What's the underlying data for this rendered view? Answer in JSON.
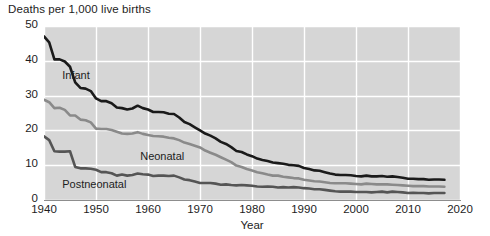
{
  "chart_data": {
    "type": "line",
    "title": "Deaths per 1,000 live births",
    "subtitle": "",
    "xlabel": "Year",
    "ylabel": "Deaths per 1,000 live births",
    "xlim": [
      1940,
      2020
    ],
    "ylim": [
      0,
      50
    ],
    "grid": true,
    "legend_position": "inline-annotations",
    "xticks": [
      "1940",
      "1950",
      "1960",
      "1970",
      "1980",
      "1990",
      "2000",
      "2010",
      "2020"
    ],
    "xtick_values": [
      1940,
      1950,
      1960,
      1970,
      1980,
      1990,
      2000,
      2010,
      2020
    ],
    "yticks": [
      "0",
      "10",
      "20",
      "30",
      "40",
      "50"
    ],
    "ytick_values": [
      0,
      10,
      20,
      30,
      40,
      50
    ],
    "x": [
      1940,
      1941,
      1942,
      1943,
      1944,
      1945,
      1946,
      1947,
      1948,
      1949,
      1950,
      1951,
      1952,
      1953,
      1954,
      1955,
      1956,
      1957,
      1958,
      1959,
      1960,
      1961,
      1962,
      1963,
      1964,
      1965,
      1966,
      1967,
      1968,
      1969,
      1970,
      1971,
      1972,
      1973,
      1974,
      1975,
      1976,
      1977,
      1978,
      1979,
      1980,
      1981,
      1982,
      1983,
      1984,
      1985,
      1986,
      1987,
      1988,
      1989,
      1990,
      1991,
      1992,
      1993,
      1994,
      1995,
      1996,
      1997,
      1998,
      1999,
      2000,
      2001,
      2002,
      2003,
      2004,
      2005,
      2006,
      2007,
      2008,
      2009,
      2010,
      2011,
      2012,
      2013,
      2014,
      2015,
      2016,
      2017
    ],
    "series": [
      {
        "name": "Infant",
        "color": "#1a1a1a",
        "label_position": {
          "x": 1943.5,
          "y": 35.5
        },
        "values": [
          47.0,
          45.3,
          40.4,
          40.4,
          39.8,
          38.3,
          33.8,
          32.2,
          32.0,
          31.3,
          29.2,
          28.4,
          28.4,
          27.8,
          26.6,
          26.4,
          26.0,
          26.3,
          27.1,
          26.4,
          26.0,
          25.3,
          25.3,
          25.2,
          24.8,
          24.7,
          23.7,
          22.4,
          21.8,
          20.9,
          20.0,
          19.1,
          18.5,
          17.7,
          16.7,
          16.1,
          15.2,
          14.1,
          13.8,
          13.1,
          12.6,
          11.9,
          11.5,
          11.2,
          10.8,
          10.6,
          10.4,
          10.1,
          10.0,
          9.8,
          9.2,
          8.9,
          8.5,
          8.4,
          8.0,
          7.6,
          7.3,
          7.2,
          7.2,
          7.1,
          6.9,
          6.8,
          7.0,
          6.8,
          6.8,
          6.9,
          6.7,
          6.8,
          6.6,
          6.4,
          6.1,
          6.1,
          6.0,
          6.0,
          5.8,
          5.9,
          5.9,
          5.8
        ]
      },
      {
        "name": "Neonatal",
        "color": "#8a8a8a",
        "label_position": {
          "x": 1958.5,
          "y": 12.5
        },
        "values": [
          28.8,
          28.1,
          26.4,
          26.5,
          25.9,
          24.3,
          24.3,
          23.1,
          22.9,
          22.3,
          20.5,
          20.4,
          20.4,
          20.1,
          19.6,
          19.1,
          19.0,
          19.1,
          19.5,
          19.0,
          18.7,
          18.4,
          18.3,
          18.2,
          17.9,
          17.7,
          17.2,
          16.5,
          16.1,
          15.6,
          15.1,
          14.2,
          13.6,
          13.0,
          12.3,
          11.6,
          10.9,
          9.9,
          9.5,
          8.9,
          8.5,
          8.0,
          7.7,
          7.3,
          7.0,
          7.0,
          6.7,
          6.5,
          6.3,
          6.2,
          5.8,
          5.6,
          5.4,
          5.3,
          5.1,
          4.9,
          4.8,
          4.8,
          4.8,
          4.7,
          4.6,
          4.5,
          4.7,
          4.6,
          4.5,
          4.5,
          4.5,
          4.4,
          4.3,
          4.2,
          4.1,
          4.0,
          4.0,
          4.0,
          3.9,
          3.9,
          3.9,
          3.8
        ]
      },
      {
        "name": "Postneonatal",
        "color": "#555555",
        "label_position": {
          "x": 1943.5,
          "y": 4.2
        },
        "values": [
          18.3,
          17.2,
          14.0,
          13.9,
          13.9,
          14.0,
          9.5,
          9.1,
          9.1,
          9.0,
          8.7,
          8.0,
          8.0,
          7.7,
          7.0,
          7.3,
          7.0,
          7.2,
          7.6,
          7.4,
          7.3,
          6.9,
          7.0,
          7.0,
          6.9,
          7.0,
          6.5,
          5.9,
          5.7,
          5.3,
          4.9,
          4.9,
          4.9,
          4.7,
          4.4,
          4.5,
          4.3,
          4.2,
          4.3,
          4.2,
          4.1,
          3.9,
          3.8,
          3.9,
          3.8,
          3.6,
          3.7,
          3.6,
          3.7,
          3.6,
          3.4,
          3.3,
          3.1,
          3.1,
          2.9,
          2.7,
          2.5,
          2.4,
          2.4,
          2.4,
          2.3,
          2.3,
          2.3,
          2.2,
          2.3,
          2.4,
          2.2,
          2.4,
          2.3,
          2.2,
          2.0,
          2.1,
          2.0,
          2.0,
          1.9,
          2.0,
          2.0,
          2.0
        ]
      }
    ]
  },
  "style": {
    "plot_background": "#d6d6d6",
    "gridline_color": "#ffffff",
    "axis_color": "#8d8d8d",
    "text_color": "#1d1d1d"
  }
}
